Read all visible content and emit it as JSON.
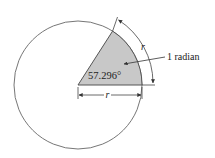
{
  "diagram": {
    "angle_label": "57.296°",
    "arc_label": "r",
    "radius_label": "r",
    "callout_label": "1 radian",
    "colors": {
      "sector_fill": "#c8c8c8",
      "stroke": "#555555",
      "background": "#ffffff"
    },
    "geometry": {
      "center": [
        78,
        85
      ],
      "radius": 64,
      "sector_angle_deg": 57.296
    }
  }
}
